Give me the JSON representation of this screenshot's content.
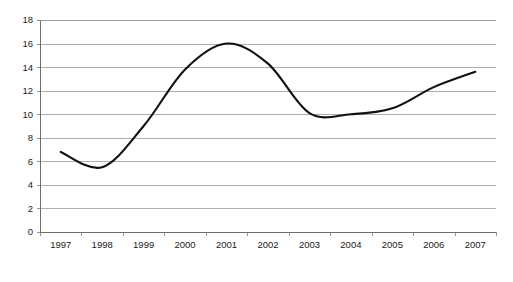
{
  "chart_data": {
    "type": "line",
    "title": "",
    "subtitle": "",
    "xlabel": "",
    "ylabel": "",
    "categories": [
      "1997",
      "1998",
      "1999",
      "2000",
      "2001",
      "2002",
      "2003",
      "2004",
      "2005",
      "2006",
      "2007"
    ],
    "series": [
      {
        "name": "",
        "values": [
          6.8,
          5.5,
          9.0,
          13.8,
          16.0,
          14.3,
          10.1,
          10.0,
          10.5,
          12.3,
          13.6
        ],
        "color": "#111111",
        "smooth": true,
        "markers": false
      }
    ],
    "ylim": [
      0,
      18
    ],
    "ytick_step": 2,
    "ytick_labels": [
      "0",
      "2",
      "4",
      "6",
      "8",
      "10",
      "12",
      "14",
      "16",
      "18"
    ],
    "grid": {
      "horizontal": true,
      "vertical": false,
      "color": "#9a9a9a"
    },
    "legend": {
      "visible": false,
      "position": "none",
      "entries": []
    },
    "annotations": [],
    "axis_style": {
      "axis_color": "#6e6e6e",
      "tick_color": "#8a8a8a",
      "ticks_between_categories": true,
      "frame": "left-bottom-top-gridlines"
    },
    "background": "#ffffff"
  },
  "layout": {
    "plot_left": 40,
    "plot_right": 496,
    "plot_top": 20,
    "plot_bottom": 232
  }
}
